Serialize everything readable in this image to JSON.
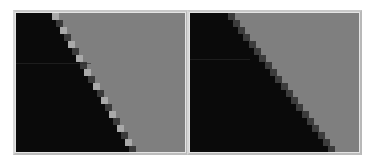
{
  "figure": {
    "panels": [
      {
        "id": "left",
        "label": "",
        "variant": "fringed-aliasing",
        "colors": {
          "dark": "#0a0a0a",
          "light": "#7f7f7f",
          "fringe_bright": "#a9a9a9",
          "fringe_dark": "#3a3a3a",
          "frame": "#c8c8c8"
        }
      },
      {
        "id": "right",
        "label": "",
        "variant": "staircase-aliasing",
        "colors": {
          "dark": "#0a0a0a",
          "light": "#7f7f7f",
          "transition": "#3c3c3c",
          "frame": "#c8c8c8"
        }
      }
    ],
    "grid": {
      "cell_px": 7,
      "rows": 20
    }
  }
}
